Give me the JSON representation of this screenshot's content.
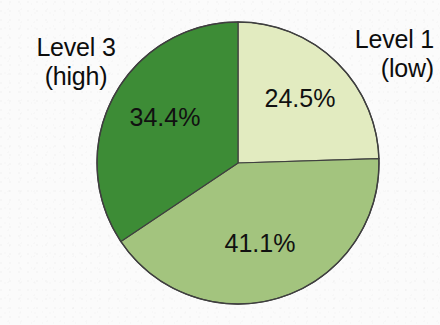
{
  "figure": {
    "background_color": "#fbfbfb",
    "text_color": "#0d0d0d",
    "outline_color": "#3f3f3f"
  },
  "labels": {
    "level3": {
      "line1": "Level 3",
      "line2": "(high)"
    },
    "level1": {
      "line1": "Level 1",
      "line2": "(low)"
    }
  },
  "chart_data": {
    "type": "pie",
    "title": "",
    "subtitle": "",
    "xlabel": "",
    "ylabel": "",
    "legend_position": "none",
    "grid": false,
    "start_angle_deg": 0,
    "direction": "clockwise",
    "center": [
      238,
      163
    ],
    "radius": 141,
    "categories": [
      "Level 1 (low)",
      "Level 2",
      "Level 3 (high)"
    ],
    "values": [
      24.5,
      41.1,
      34.4
    ],
    "value_labels": [
      "24.5%",
      "41.1%",
      "34.4%"
    ],
    "colors": [
      "#e2ebc0",
      "#a3c47e",
      "#3d8c36"
    ],
    "slices": [
      {
        "name": "Level 1 (low)",
        "value": 24.5,
        "label": "24.5%",
        "color": "#e2ebc0",
        "start_angle_deg": 0,
        "end_angle_deg": 88.2,
        "label_x": 300,
        "label_y": 100
      },
      {
        "name": "Level 2",
        "value": 41.1,
        "label": "41.1%",
        "color": "#a3c47e",
        "start_angle_deg": 88.2,
        "end_angle_deg": 236.16,
        "label_x": 260,
        "label_y": 245
      },
      {
        "name": "Level 3 (high)",
        "value": 34.4,
        "label": "34.4%",
        "color": "#3d8c36",
        "start_angle_deg": 236.16,
        "end_angle_deg": 360,
        "label_x": 165,
        "label_y": 119
      }
    ]
  }
}
